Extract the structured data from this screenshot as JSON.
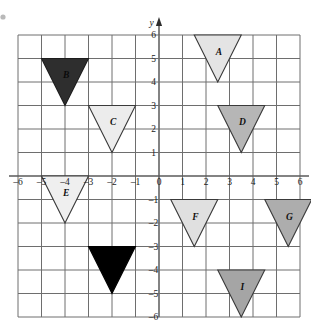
{
  "figure": {
    "kind": "coordinate-grid-with-triangles",
    "axis_labels": {
      "y": "y"
    },
    "x_ticks": [
      "–6",
      "–5",
      "–4",
      "–3",
      "–2",
      "–1",
      "0",
      "1",
      "2",
      "3",
      "4",
      "5",
      "6"
    ],
    "y_ticks": [
      "6",
      "5",
      "4",
      "3",
      "2",
      "1",
      "0",
      "–1",
      "–2",
      "–3",
      "–4",
      "–5",
      "–6"
    ],
    "grid": {
      "x_min": -6,
      "x_max": 6,
      "y_min": -6,
      "y_max": 6,
      "show_grid": true,
      "grid_color": "#6e6e6e",
      "axis_color": "#5a5a5a"
    },
    "origin_label": "0"
  },
  "chart_data": {
    "type": "scatter",
    "title": "",
    "xlabel": "",
    "ylabel": "y",
    "xlim": [
      -6,
      6
    ],
    "ylim": [
      -6,
      6
    ],
    "grid": true,
    "legend": "none",
    "shapes": [
      {
        "label": "A",
        "shape": "triangle-down",
        "fill": "#e4e4e4",
        "stroke": "#3a3a3a",
        "left": 1.5,
        "right": 3.5,
        "top": 6,
        "apex_y": 4,
        "apex_x": 2.5,
        "label_x": 2.55,
        "label_y": 5.3
      },
      {
        "label": "B",
        "shape": "triangle-down",
        "fill": "#2e2e2e",
        "stroke": "#1c1c1c",
        "left": -5,
        "right": -3,
        "top": 5,
        "apex_y": 3,
        "apex_x": -4,
        "label_x": -3.95,
        "label_y": 4.3
      },
      {
        "label": "C",
        "shape": "triangle-down",
        "fill": "#ececec",
        "stroke": "#3a3a3a",
        "left": -3,
        "right": -1,
        "top": 3,
        "apex_y": 1,
        "apex_x": -2,
        "label_x": -1.95,
        "label_y": 2.3
      },
      {
        "label": "D",
        "shape": "triangle-down",
        "fill": "#b6b6b6",
        "stroke": "#3a3a3a",
        "left": 2.5,
        "right": 4.5,
        "top": 3,
        "apex_y": 1,
        "apex_x": 3.5,
        "label_x": 3.55,
        "label_y": 2.3
      },
      {
        "label": "E",
        "shape": "triangle-down",
        "fill": "#efefef",
        "stroke": "#3a3a3a",
        "left": -5,
        "right": -3,
        "top": 0,
        "apex_y": -2,
        "apex_x": -4,
        "label_x": -3.95,
        "label_y": -0.72
      },
      {
        "label": "F",
        "shape": "triangle-down",
        "fill": "#e0e0e0",
        "stroke": "#3a3a3a",
        "left": 0.5,
        "right": 2.5,
        "top": -1,
        "apex_y": -3,
        "apex_x": 1.5,
        "label_x": 1.55,
        "label_y": -1.72
      },
      {
        "label": "G",
        "shape": "triangle-down",
        "fill": "#adadad",
        "stroke": "#3a3a3a",
        "left": 4.5,
        "right": 6.5,
        "top": -1,
        "apex_y": -3,
        "apex_x": 5.5,
        "label_x": 5.55,
        "label_y": -1.72
      },
      {
        "label": "",
        "shape": "triangle-down",
        "fill": "#000000",
        "stroke": "#000000",
        "left": -3,
        "right": -1,
        "top": -3,
        "apex_y": -5,
        "apex_x": -2,
        "label_x": -1.95,
        "label_y": -3.72
      },
      {
        "label": "I",
        "shape": "triangle-down",
        "fill": "#a5a5a5",
        "stroke": "#3a3a3a",
        "left": 2.5,
        "right": 4.5,
        "top": -4,
        "apex_y": -6,
        "apex_x": 3.5,
        "label_x": 3.55,
        "label_y": -4.72
      }
    ]
  }
}
